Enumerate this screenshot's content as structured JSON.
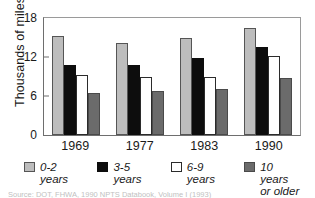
{
  "chart_data": {
    "type": "bar",
    "title": "",
    "xlabel": "",
    "ylabel": "Thousands of miles",
    "categories": [
      "1969",
      "1977",
      "1983",
      "1990"
    ],
    "yticks": [
      0,
      6,
      12,
      18
    ],
    "ylim": [
      0,
      18
    ],
    "grid": false,
    "legend_position": "bottom",
    "series": [
      {
        "name": "0-2 years",
        "color": "#bdbdbd",
        "values": [
          15.3,
          14.1,
          15.0,
          16.4
        ]
      },
      {
        "name": "3-5 years",
        "color": "#0d0d0d",
        "values": [
          10.8,
          10.7,
          11.8,
          13.5
        ]
      },
      {
        "name": "6-9 years",
        "color": "#ffffff",
        "values": [
          9.3,
          9.0,
          9.0,
          12.2
        ]
      },
      {
        "name": "10 years\nor older",
        "color": "#6b6b6b",
        "values": [
          6.5,
          6.8,
          7.1,
          8.7
        ]
      }
    ]
  },
  "axis": {
    "y_title": "Thousands of miles",
    "y_tick_labels": [
      "18",
      "12",
      "6",
      "0"
    ],
    "x_tick_labels": [
      "1969",
      "1977",
      "1983",
      "1990"
    ]
  },
  "legend": {
    "items": [
      {
        "label": "0-2 years"
      },
      {
        "label": "3-5 years"
      },
      {
        "label": "6-9 years"
      },
      {
        "label": "10 years\nor older"
      }
    ]
  },
  "source": {
    "text": "Source:  DOT, FHWA, 1990 NPTS Databook, Volume I (1993)"
  }
}
